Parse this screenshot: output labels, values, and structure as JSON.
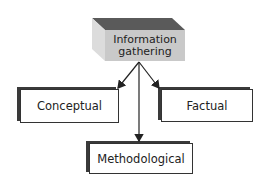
{
  "diagram": {
    "root": {
      "line1": "Information",
      "line2": "gathering"
    },
    "children": [
      {
        "label": "Conceptual"
      },
      {
        "label": "Factual"
      },
      {
        "label": "Methodological"
      }
    ],
    "colors": {
      "cube_top": "#5a5a5a",
      "cube_side": "#d9d9d9",
      "cube_front": "#c9c9c9",
      "box_border": "#333333",
      "arrow": "#222222"
    }
  }
}
